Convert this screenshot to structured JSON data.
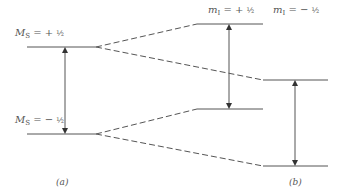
{
  "diagram": {
    "line_color": "#555555",
    "left_levels": [
      {
        "label_symbol": "M",
        "label_sub": "S",
        "label_eq": "= +",
        "label_frac": "½",
        "y": 47
      },
      {
        "label_symbol": "M",
        "label_sub": "S",
        "label_eq": "= −",
        "label_frac": "½",
        "y": 134
      }
    ],
    "right_headers": [
      {
        "label_symbol": "m",
        "label_sub": "I",
        "label_eq": "= +",
        "label_frac": "½"
      },
      {
        "label_symbol": "m",
        "label_sub": "I",
        "label_eq": "= −",
        "label_frac": "½"
      }
    ],
    "right_levels": [
      {
        "name": "Ms+1/2, mI+1/2",
        "x1": 197,
        "x2": 263,
        "y": 24
      },
      {
        "name": "Ms+1/2, mI-1/2",
        "x1": 263,
        "x2": 328,
        "y": 80
      },
      {
        "name": "Ms-1/2, mI+1/2",
        "x1": 197,
        "x2": 263,
        "y": 109
      },
      {
        "name": "Ms-1/2, mI-1/2",
        "x1": 263,
        "x2": 328,
        "y": 166
      }
    ],
    "transitions": [
      {
        "name": "transition-a",
        "x": 65,
        "y1": 47,
        "y2": 134
      },
      {
        "name": "transition-b1",
        "x": 229,
        "y1": 24,
        "y2": 109
      },
      {
        "name": "transition-b2",
        "x": 295,
        "y1": 80,
        "y2": 166
      }
    ],
    "panel_labels": {
      "a": "(a)",
      "b": "(b)"
    }
  }
}
